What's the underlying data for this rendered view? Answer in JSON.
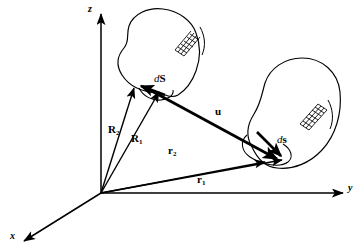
{
  "figure": {
    "type": "vector-diagram",
    "background_color": "#ffffff",
    "stroke_color": "#000000"
  },
  "axes": {
    "z": {
      "label": "z",
      "origin": [
        101,
        193
      ],
      "tip": [
        101,
        12
      ]
    },
    "y": {
      "label": "y",
      "origin": [
        101,
        193
      ],
      "tip": [
        345,
        193
      ]
    },
    "x": {
      "label": "x",
      "origin": [
        101,
        193
      ],
      "tip": [
        22,
        242
      ]
    }
  },
  "vectors": [
    {
      "name": "R2",
      "label": "R",
      "subscript": "2",
      "from": [
        101,
        193
      ],
      "to": [
        133,
        86
      ],
      "weight": "thin"
    },
    {
      "name": "R1",
      "label": "R",
      "subscript": "1",
      "from": [
        101,
        193
      ],
      "to": [
        159,
        90
      ],
      "weight": "thin"
    },
    {
      "name": "r2",
      "label": "r",
      "subscript": "2",
      "from": [
        101,
        193
      ],
      "to": [
        266,
        162
      ],
      "weight": "thin"
    },
    {
      "name": "r1",
      "label": "r",
      "subscript": "1",
      "from": [
        101,
        193
      ],
      "to": [
        283,
        160
      ],
      "weight": "thin"
    },
    {
      "name": "u",
      "label": "u",
      "subscript": "",
      "from": [
        147,
        89
      ],
      "to": [
        279,
        160
      ],
      "weight": "thick"
    },
    {
      "name": "dS",
      "label": "dS",
      "subscript": "",
      "from": [
        164,
        94
      ],
      "to": [
        140,
        85
      ],
      "weight": "thick"
    },
    {
      "name": "ds",
      "label": "ds",
      "subscript": "",
      "from": [
        258,
        133
      ],
      "to": [
        283,
        158
      ],
      "weight": "thick"
    }
  ],
  "labels": {
    "z_axis": "z",
    "y_axis": "y",
    "x_axis": "x",
    "u": "u",
    "dS_d": "d",
    "dS_S": "S",
    "ds_d": "d",
    "ds_s": "s",
    "R2_base": "R",
    "R2_sub": "2",
    "R1_base": "R",
    "R1_sub": "1",
    "r2_base": "r",
    "r2_sub": "2",
    "r1_base": "r",
    "r1_sub": "1"
  },
  "surfaces": [
    {
      "name": "upper-left-surface",
      "hatch_patch": "grid",
      "hatch_center": [
        184,
        40
      ]
    },
    {
      "name": "right-surface",
      "hatch_patch": "grid",
      "hatch_center": [
        310,
        114
      ]
    }
  ]
}
